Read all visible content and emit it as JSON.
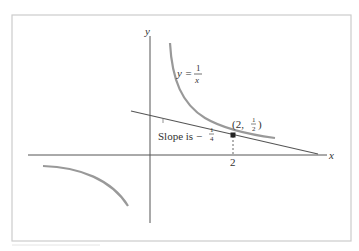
{
  "figure": {
    "axes": {
      "x_label": "x",
      "y_label": "y"
    },
    "curve": {
      "equation_lhs": "y =",
      "equation_num": "1",
      "equation_den": "x",
      "color": "#999999"
    },
    "tangent_point": {
      "label_open": "(2,",
      "label_num": "1",
      "label_den": "2",
      "label_close": ")",
      "x_tick_label": "2"
    },
    "tangent_line": {
      "slope_text": "Slope is −",
      "slope_num": "1",
      "slope_den": "4",
      "color": "#555555"
    },
    "colors": {
      "frame": "#cccccc",
      "axes": "#555555",
      "point": "#222222"
    }
  }
}
